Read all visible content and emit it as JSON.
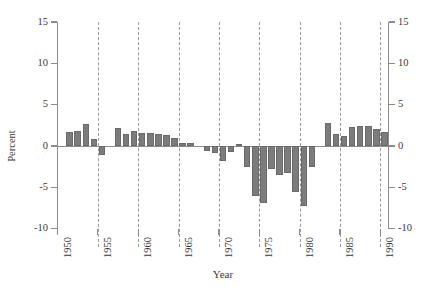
{
  "chart_data": {
    "type": "bar",
    "title": "",
    "xlabel": "Year",
    "ylabel": "Percent",
    "xlim": [
      1950,
      1991
    ],
    "ylim": [
      -10,
      15
    ],
    "ytick_labels": [
      "15",
      "10",
      "5",
      "0",
      "-5",
      "-10"
    ],
    "ytick_values": [
      15,
      10,
      5,
      0,
      -5,
      -10
    ],
    "xtick_labels": [
      "1950",
      "1955",
      "1960",
      "1965",
      "1970",
      "1975",
      "1980",
      "1985",
      "1990"
    ],
    "xtick_values": [
      1950,
      1955,
      1960,
      1965,
      1970,
      1975,
      1980,
      1985,
      1990
    ],
    "grid": "vertical-dashed",
    "legend": "none",
    "bar_color": "#7c7c7c",
    "axis_color": "#8c8c8c",
    "gridline_color": "#9a9a9a",
    "dual_y_axis": true,
    "categories": [
      1951,
      1952,
      1953,
      1954,
      1955,
      1956,
      1957,
      1958,
      1959,
      1960,
      1961,
      1962,
      1963,
      1964,
      1965,
      1966,
      1967,
      1968,
      1969,
      1970,
      1971,
      1972,
      1973,
      1974,
      1975,
      1976,
      1977,
      1978,
      1979,
      1980,
      1981,
      1982,
      1983,
      1984,
      1985,
      1986,
      1987,
      1988,
      1989,
      1990
    ],
    "values": [
      1.7,
      1.8,
      2.7,
      0.9,
      -1.1,
      0.0,
      2.2,
      1.4,
      1.8,
      1.6,
      1.6,
      1.4,
      1.3,
      1.0,
      0.4,
      0.4,
      0.0,
      -0.6,
      -0.9,
      -1.8,
      -0.7,
      0.3,
      -2.6,
      -6.1,
      -6.9,
      -2.8,
      -3.5,
      -3.3,
      -5.6,
      -7.2,
      -2.5,
      0.0,
      2.8,
      1.5,
      1.2,
      2.3,
      2.4,
      2.4,
      2.0,
      1.7
    ]
  }
}
